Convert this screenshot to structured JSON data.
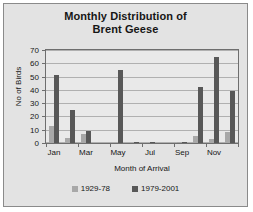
{
  "chart_data": {
    "type": "bar",
    "title": "Monthly Distribution of Brent Geese",
    "title_lines": [
      "Monthly Distribution of",
      "Brent Geese"
    ],
    "xlabel": "Month of Arrival",
    "ylabel": "No of Birds",
    "ylim": [
      0,
      70
    ],
    "ytick_step": 10,
    "yticks": [
      70,
      60,
      50,
      40,
      30,
      20,
      10,
      0
    ],
    "grid": true,
    "legend_position": "bottom",
    "categories": [
      "Jan",
      "Feb",
      "Mar",
      "Apr",
      "May",
      "Jun",
      "Jul",
      "Aug",
      "Sep",
      "Oct",
      "Nov",
      "Dec"
    ],
    "xtick_labels": [
      "Jan",
      "Mar",
      "May",
      "Jul",
      "Sep",
      "Nov"
    ],
    "series": [
      {
        "name": "1929-78",
        "color": "#a8a8a8",
        "values": [
          13,
          4,
          7,
          0,
          0,
          0,
          0,
          0,
          1,
          5,
          3,
          8
        ]
      },
      {
        "name": "1979-2001",
        "color": "#585858",
        "values": [
          51,
          25,
          9,
          0,
          55,
          1,
          1,
          0,
          1,
          42,
          65,
          39
        ]
      }
    ]
  },
  "legend": {
    "items": [
      {
        "label": "1929-78"
      },
      {
        "label": "1979-2001"
      }
    ]
  }
}
